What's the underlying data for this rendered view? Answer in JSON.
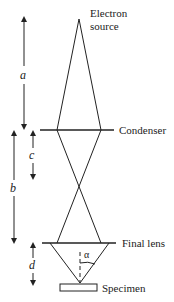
{
  "diagram": {
    "labels": {
      "source_line1": "Electron",
      "source_line2": "source",
      "condenser": "Condenser",
      "final_lens": "Final lens",
      "specimen": "Specimen",
      "alpha": "α"
    },
    "distances": {
      "a": "a",
      "b": "b",
      "c": "c",
      "d": "d"
    },
    "colors": {
      "line": "#222222",
      "background": "#ffffff"
    }
  }
}
